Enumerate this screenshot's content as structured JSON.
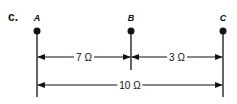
{
  "part_label": "c.",
  "nodes": [
    {
      "id": "A",
      "label": "A",
      "x": 37
    },
    {
      "id": "B",
      "label": "B",
      "x": 131
    },
    {
      "id": "C",
      "label": "C",
      "x": 223
    }
  ],
  "dimensions": [
    {
      "from": "A",
      "to": "B",
      "label": "7 Ω",
      "value": 7,
      "unit": "Ω"
    },
    {
      "from": "B",
      "to": "C",
      "label": "3 Ω",
      "value": 3,
      "unit": "Ω"
    },
    {
      "from": "A",
      "to": "C",
      "label": "10 Ω",
      "value": 10,
      "unit": "Ω"
    }
  ],
  "colors": {
    "ink": "#111111",
    "background": "#ffffff"
  }
}
